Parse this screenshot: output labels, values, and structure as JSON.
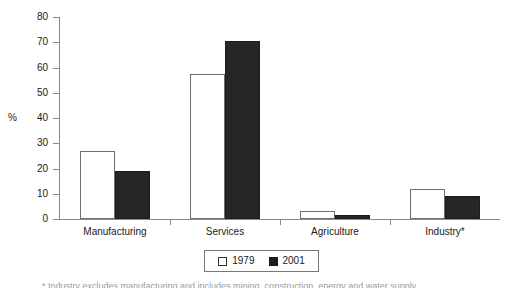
{
  "chart_data": {
    "type": "bar",
    "title": "",
    "subtitle": "",
    "xlabel": "",
    "ylabel": "%",
    "ylim": [
      0,
      80
    ],
    "yticks": [
      0,
      10,
      20,
      30,
      40,
      50,
      60,
      70,
      80
    ],
    "ytick_labels": [
      "0",
      "10",
      "20",
      "30",
      "40",
      "50",
      "60",
      "70",
      "80"
    ],
    "grid": false,
    "legend_position": "bottom-center",
    "categories": [
      "Manufacturing",
      "Services",
      "Agriculture",
      "Industry*"
    ],
    "series": [
      {
        "name": "1979",
        "color": "#ffffff",
        "edge_color": "#6e6e6e",
        "values": [
          27,
          57.5,
          3,
          11.7
        ]
      },
      {
        "name": "2001",
        "color": "#262626",
        "edge_color": "#1c1c1c",
        "values": [
          19,
          70.5,
          1.5,
          9
        ]
      }
    ],
    "footnote": "* Industry excludes manufacturing and includes mining, construction, energy and water supply"
  },
  "legend": {
    "entries": [
      {
        "label": "1979",
        "swatch": "white-square-icon"
      },
      {
        "label": "2001",
        "swatch": "black-square-icon"
      }
    ]
  }
}
